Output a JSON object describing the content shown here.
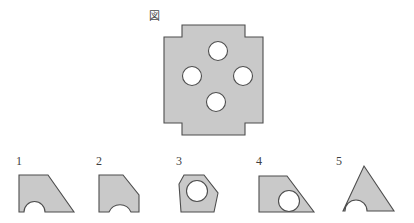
{
  "page": {
    "background_color": "#ffffff",
    "width": 414,
    "height": 223
  },
  "style": {
    "shape_fill": "#c9c9c9",
    "shape_stroke": "#4d4d4d",
    "hole_fill": "#ffffff",
    "text_color": "#3f3f3f"
  },
  "figure": {
    "caption": "図",
    "caption_position": {
      "x": 149,
      "y": 11
    },
    "name": "cross-plate-with-four-holes",
    "bounds": {
      "x": 163,
      "y": 24,
      "width": 100,
      "height": 110
    },
    "holes": [
      {
        "cx": 218,
        "cy": 50,
        "r": 9
      },
      {
        "cx": 192,
        "cy": 75,
        "r": 9
      },
      {
        "cx": 243,
        "cy": 75,
        "r": 9
      },
      {
        "cx": 216,
        "cy": 101,
        "r": 9
      }
    ]
  },
  "options": [
    {
      "label": "1",
      "name": "option-1",
      "description": "Quadrilateral with slanted top-right edge and semicircular notch cut from the bottom edge"
    },
    {
      "label": "2",
      "name": "option-2",
      "description": "Square with chamfered top-right corner and concave arc notch at bottom right"
    },
    {
      "label": "3",
      "name": "option-3",
      "description": "Pentagon with chamfered top-right corner containing one circular hole"
    },
    {
      "label": "4",
      "name": "option-4",
      "description": "Right trapezoid with slanted top-right edge containing one circular hole"
    },
    {
      "label": "5",
      "name": "option-5",
      "description": "Triangle with pointed apex and semicircular notch cut from the bottom edge"
    }
  ],
  "option_positions": [
    0,
    80,
    160,
    240,
    320
  ]
}
